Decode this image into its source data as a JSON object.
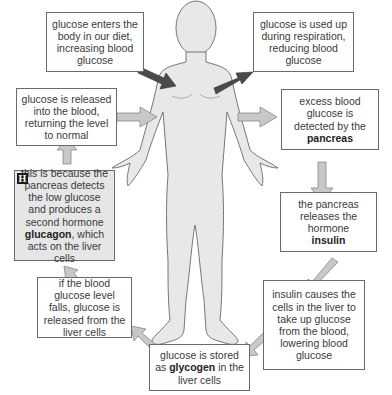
{
  "diagram": {
    "colors": {
      "body_fill": "#e8e8e8",
      "body_outline": "#777777",
      "dark_arrow": "#4a4a4a",
      "light_arrow": "#c8c8c8",
      "box_border": "#6a6a6a",
      "shaded_box": "#e6e6e6"
    },
    "boxes": {
      "diet": {
        "text": "glucose enters the body in our diet, increasing blood glucose"
      },
      "respiration": {
        "text": "glucose is used up during respiration, reducing blood glucose"
      },
      "released_normal": {
        "text": "glucose is released into the blood, returning the level to normal"
      },
      "excess_detected": {
        "pre": "excess blood glucose is detected by the ",
        "bold": "pancreas"
      },
      "glucagon": {
        "badge": "H",
        "pre": "this is because the pancreas detects the low glucose and produces a second hormone ",
        "bold": "glucagon",
        "post": ", which acts on the liver cells"
      },
      "insulin_release": {
        "pre": "the pancreas releases the hormone ",
        "bold": "insulin"
      },
      "level_falls": {
        "text": "if the blood glucose level falls, glucose is released from the liver cells"
      },
      "insulin_effect": {
        "text": "insulin causes the cells in the liver to take up glucose from the blood, lowering blood glucose"
      },
      "glycogen": {
        "pre": "glucose is stored as ",
        "bold": "glycogen",
        "post": " in the liver cells"
      }
    },
    "arrows": [
      {
        "from": "diet",
        "to": "body",
        "style": "dark"
      },
      {
        "from": "body",
        "to": "respiration",
        "style": "dark"
      },
      {
        "from": "released_normal",
        "to": "body",
        "style": "light"
      },
      {
        "from": "body",
        "to": "excess_detected",
        "style": "light"
      },
      {
        "from": "excess_detected",
        "to": "insulin_release",
        "style": "light"
      },
      {
        "from": "insulin_release",
        "to": "insulin_effect",
        "style": "light"
      },
      {
        "from": "insulin_effect",
        "to": "glycogen",
        "style": "light"
      },
      {
        "from": "glycogen",
        "to": "level_falls",
        "style": "light"
      },
      {
        "from": "level_falls",
        "to": "glucagon",
        "style": "light"
      },
      {
        "from": "glucagon",
        "to": "released_normal",
        "style": "light"
      }
    ]
  }
}
